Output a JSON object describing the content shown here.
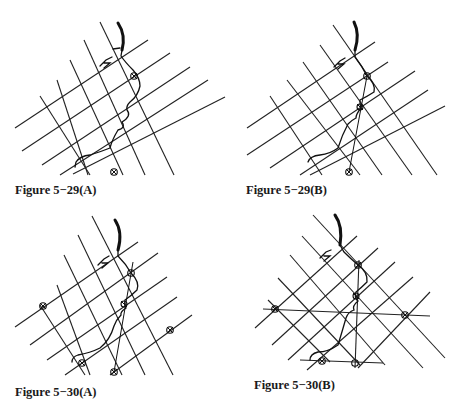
{
  "figures": [
    {
      "id": "5-29A",
      "caption": "Figure 5−29(A)"
    },
    {
      "id": "5-29B",
      "caption": "Figure 5−29(B)"
    },
    {
      "id": "5-30A",
      "caption": "Figure 5−30(A)"
    },
    {
      "id": "5-30B",
      "caption": "Figure 5−30(B)"
    }
  ]
}
